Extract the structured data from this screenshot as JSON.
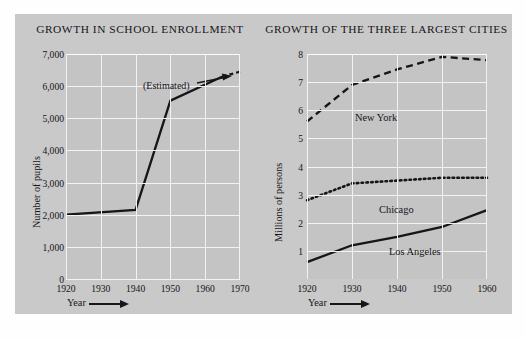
{
  "figure": {
    "background": "#c9c9c9",
    "ink": "#15151a",
    "gridline_color": "#f2f2f2"
  },
  "chart_data": [
    {
      "id": "school-enrollment",
      "type": "line",
      "title": "GROWTH IN SCHOOL ENROLLMENT",
      "xlabel": "Year",
      "ylabel": "Number of pupils",
      "xlim": [
        1920,
        1970
      ],
      "ylim": [
        0,
        7000
      ],
      "xticks": [
        "1920",
        "1930",
        "1940",
        "1950",
        "1960",
        "1970"
      ],
      "xtick_values": [
        1920,
        1930,
        1940,
        1950,
        1960,
        1970
      ],
      "yticks": [
        "0",
        "1,000",
        "2,000",
        "3,000",
        "4,000",
        "5,000",
        "6,000",
        "7,000"
      ],
      "ytick_values": [
        0,
        1000,
        2000,
        3000,
        4000,
        5000,
        6000,
        7000
      ],
      "grid": true,
      "legend": "none",
      "annotations": [
        {
          "text": "(Estimated)",
          "points_to": "dashed tail of the enrollment curve"
        }
      ],
      "series": [
        {
          "name": "Enrollment",
          "style": "solid",
          "x": [
            1920,
            1940,
            1950,
            1965,
            1970
          ],
          "values": [
            2000,
            2150,
            5550,
            6300,
            6450
          ],
          "estimated_from_x": 1965,
          "estimated_style": "dashed"
        }
      ]
    },
    {
      "id": "three-largest-cities",
      "type": "line",
      "title": "GROWTH OF THE THREE LARGEST CITIES",
      "xlabel": "Year",
      "ylabel": "Millions of persons",
      "xlim": [
        1920,
        1960
      ],
      "ylim": [
        0,
        8
      ],
      "xticks": [
        "1920",
        "1930",
        "1940",
        "1950",
        "1960"
      ],
      "xtick_values": [
        1920,
        1930,
        1940,
        1950,
        1960
      ],
      "yticks": [
        "1",
        "2",
        "3",
        "4",
        "5",
        "6",
        "7",
        "8"
      ],
      "ytick_values": [
        1,
        2,
        3,
        4,
        5,
        6,
        7,
        8
      ],
      "grid": true,
      "legend": "inline-labels",
      "series": [
        {
          "name": "New York",
          "style": "dashed",
          "x": [
            1920,
            1930,
            1940,
            1950,
            1960
          ],
          "values": [
            5.6,
            6.9,
            7.45,
            7.9,
            7.78
          ]
        },
        {
          "name": "Chicago",
          "style": "dotted",
          "x": [
            1920,
            1930,
            1940,
            1950,
            1960
          ],
          "values": [
            2.8,
            3.4,
            3.5,
            3.6,
            3.6
          ]
        },
        {
          "name": "Los Angeles",
          "style": "solid",
          "x": [
            1920,
            1930,
            1940,
            1950,
            1960
          ],
          "values": [
            0.6,
            1.2,
            1.5,
            1.85,
            2.45
          ]
        }
      ]
    }
  ]
}
